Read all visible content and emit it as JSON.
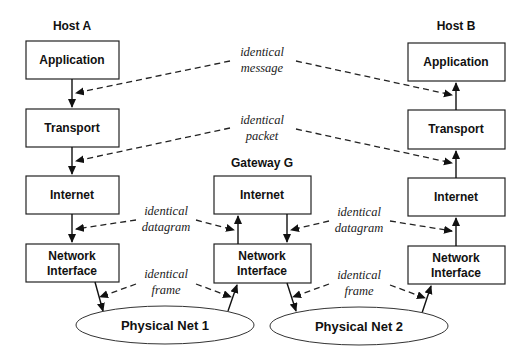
{
  "hosts": {
    "a": {
      "title": "Host A",
      "layers": [
        "Application",
        "Transport",
        "Internet",
        "Network",
        "Interface"
      ]
    },
    "b": {
      "title": "Host B",
      "layers": [
        "Application",
        "Transport",
        "Internet",
        "Network",
        "Interface"
      ]
    },
    "g": {
      "title": "Gateway G",
      "layers": [
        "Internet",
        "Network",
        "Interface"
      ]
    }
  },
  "networks": [
    "Physical Net 1",
    "Physical Net 2"
  ],
  "annotations": {
    "message": [
      "identical",
      "message"
    ],
    "packet": [
      "identical",
      "packet"
    ],
    "datagram": [
      "identical",
      "datagram"
    ],
    "frame": [
      "identical",
      "frame"
    ]
  }
}
